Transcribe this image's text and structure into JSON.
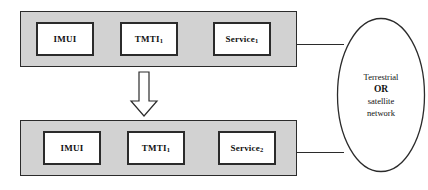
{
  "diagram": {
    "colors": {
      "panel_fill": "#d2d2d2",
      "box_fill": "#ffffff",
      "stroke": "#2b2b2b",
      "background": "#ffffff"
    },
    "panels": [
      {
        "name": "top-terminal",
        "boxes": [
          {
            "label": "IMUI",
            "subscript": ""
          },
          {
            "label": "TMTI",
            "subscript": "1"
          },
          {
            "label": "Service",
            "subscript": "1"
          }
        ]
      },
      {
        "name": "bottom-terminal",
        "boxes": [
          {
            "label": "IMUI",
            "subscript": ""
          },
          {
            "label": "TMTI",
            "subscript": "1"
          },
          {
            "label": "Service",
            "subscript": "2"
          }
        ]
      }
    ],
    "arrow": {
      "direction": "down",
      "style": "hollow-block"
    },
    "network": {
      "shape": "ellipse",
      "line1": "Terrestrial",
      "line2": "OR",
      "line3": "satellite",
      "line4": "network"
    },
    "connectors": [
      {
        "name": "top-connector",
        "from": "top-terminal",
        "to": "network"
      },
      {
        "name": "bottom-connector",
        "from": "bottom-terminal",
        "to": "network"
      }
    ]
  }
}
